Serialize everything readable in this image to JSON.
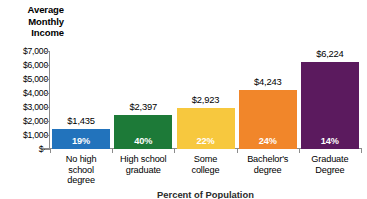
{
  "chart_data": {
    "type": "bar",
    "title": "Average Monthly Income",
    "title_lines": [
      "Average",
      "Monthly",
      "Income"
    ],
    "xlabel": "Percent of Population",
    "ylabel": "Average Monthly Income",
    "categories": [
      "No high school degree",
      "High school graduate",
      "Some college",
      "Bachelor's degree",
      "Graduate Degree"
    ],
    "category_lines": [
      [
        "No high",
        "school",
        "degree"
      ],
      [
        "High school",
        "graduate"
      ],
      [
        "Some",
        "college"
      ],
      [
        "Bachelor's",
        "degree"
      ],
      [
        "Graduate",
        "Degree"
      ]
    ],
    "values": [
      1435,
      2397,
      2923,
      4243,
      6224
    ],
    "value_labels": [
      "$1,435",
      "$2,397",
      "$2,923",
      "$4,243",
      "$6,224"
    ],
    "percent_labels": [
      "19%",
      "40%",
      "22%",
      "24%",
      "14%"
    ],
    "percents": [
      19,
      40,
      22,
      24,
      14
    ],
    "colors": [
      "#2273BC",
      "#1D7A38",
      "#F7C83E",
      "#F1862A",
      "#5B1A5E"
    ],
    "ylim": [
      0,
      7000
    ],
    "ytick_values": [
      7000,
      6000,
      5000,
      4000,
      3000,
      2000,
      1000,
      0
    ],
    "ytick_labels": [
      "$7,000",
      "$6,000",
      "$5,000",
      "$4,000",
      "$3,000",
      "$2,000",
      "$1,000",
      "$–"
    ],
    "grid": false,
    "legend": false
  }
}
